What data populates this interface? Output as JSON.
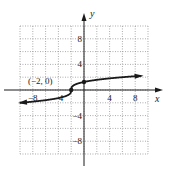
{
  "chart_data": {
    "type": "line",
    "title": "",
    "function": "y = cbrt(x + 2)",
    "xlabel": "x",
    "ylabel": "y",
    "xlim": [
      -10,
      10
    ],
    "ylim": [
      -10,
      10
    ],
    "grid": true,
    "grid_step": 2,
    "xticks": [
      -8,
      -4,
      4,
      8
    ],
    "yticks": [
      8,
      4,
      -4,
      -8
    ],
    "xtick_labels": [
      "−8",
      "−4",
      "4",
      "8"
    ],
    "ytick_labels": [
      "8",
      "4",
      "−4",
      "−8"
    ],
    "points": [
      {
        "x": -10,
        "y": -2
      },
      {
        "x": -3,
        "y": -1
      },
      {
        "x": -2,
        "y": 0
      },
      {
        "x": -1,
        "y": 1
      },
      {
        "x": 0,
        "y": 1.26
      },
      {
        "x": 6,
        "y": 2
      },
      {
        "x": 9,
        "y": 2.22
      }
    ],
    "marked_points": [
      {
        "x": -2,
        "y": 0,
        "label": "(−2, 0)"
      },
      {
        "x": 0,
        "y": 1.26,
        "label": ""
      }
    ],
    "annotations": [
      {
        "text": "(−2, 0)",
        "x": -2,
        "y": 0
      }
    ],
    "arrows": "both ends"
  },
  "colors": {
    "curve": "#1a1a1a",
    "axes": "#1a1a1a",
    "grid": "#8a8a8a",
    "background": "#ffffff"
  }
}
